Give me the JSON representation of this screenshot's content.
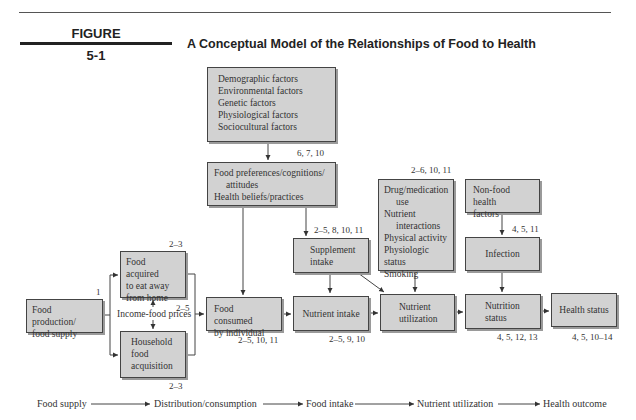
{
  "figure": {
    "label": "FIGURE",
    "number": "5-1",
    "title": "A Conceptual Model of the Relationships of Food to Health"
  },
  "boxes": {
    "factors": {
      "lines": [
        "Demographic factors",
        "Environmental factors",
        "Genetic factors",
        "Physiological factors",
        "Sociocultural factors"
      ]
    },
    "preferences": {
      "lines": [
        "Food preferences/cognitions/",
        "attitudes",
        "Health beliefs/practices"
      ]
    },
    "food_production": {
      "lines": [
        "Food production/",
        "food supply"
      ]
    },
    "food_away": {
      "lines": [
        "Food acquired",
        "to eat away",
        "from home"
      ]
    },
    "household": {
      "lines": [
        "Household",
        "food",
        "acquisition"
      ]
    },
    "food_consumed": {
      "lines": [
        "Food consumed",
        "by individual"
      ]
    },
    "supplement": {
      "lines": [
        "Supplement",
        "intake"
      ]
    },
    "nutrient_intake": {
      "lines": [
        "Nutrient intake"
      ]
    },
    "drug": {
      "lines": [
        "Drug/medication",
        "use",
        "Nutrient",
        "interactions",
        "Physical activity",
        "Physiologic status",
        "Smoking"
      ]
    },
    "nutrient_utilization": {
      "lines": [
        "Nutrient",
        "utilization"
      ]
    },
    "non_food": {
      "lines": [
        "Non-food health",
        "factors"
      ]
    },
    "infection": {
      "lines": [
        "Infection"
      ]
    },
    "nutrition_status": {
      "lines": [
        "Nutrition",
        "status"
      ]
    },
    "health_status": {
      "lines": [
        "Health status"
      ]
    }
  },
  "refs": {
    "preferences": "6, 7, 10",
    "food_production": "1",
    "food_away": "2–3",
    "income": "2–5",
    "household": "2–3",
    "food_consumed": "2–5, 10, 11",
    "supplement": "2–5, 8, 10, 11",
    "nutrient_intake": "2–5, 9, 10",
    "drug": "2–6, 10, 11",
    "infection": "4, 5, 11",
    "nutrition_status": "4, 5, 12, 13",
    "health_status": "4, 5, 10–14"
  },
  "labels": {
    "income_food_prices": "Income-food prices"
  },
  "bottom_flow": [
    "Food supply",
    "Distribution/consumption",
    "Food intake",
    "Nutrient utilization",
    "Health outcome"
  ],
  "colors": {
    "box_fill": "#d2d2d2",
    "box_border": "#444444",
    "line": "#444444"
  }
}
